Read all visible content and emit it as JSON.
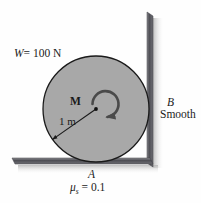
{
  "figure": {
    "labels": {
      "weight": "W = 100 N",
      "weight_symbol": "W",
      "weight_value": "= 100 N",
      "moment": "M",
      "radius": "1 m",
      "point_b": "B",
      "wall_condition": "Smooth",
      "point_a": "A",
      "friction_symbol": "μ",
      "friction_subscript": "s",
      "friction_value": "= 0.1",
      "friction_full": "μs = 0.1"
    },
    "geometry": {
      "circle_center_x": 96,
      "circle_center_y": 109,
      "circle_radius": 53,
      "ground_y": 161,
      "wall_x": 150,
      "radius_line_angle_deg": 215
    },
    "colors": {
      "background": "#fefefe",
      "circle_fill": "#a8a8a8",
      "circle_stroke": "#1a1a1a",
      "surface_dark": "#55555a",
      "shadow": "#c9c9c9",
      "text": "#1a1a1a"
    }
  }
}
